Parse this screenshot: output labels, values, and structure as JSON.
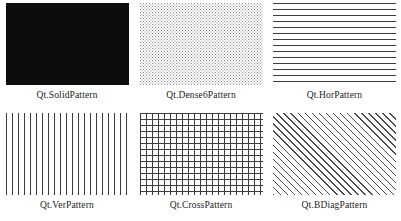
{
  "page": {
    "background_color": "#ffffff",
    "text_color": "#1c1c1c",
    "columns": 3,
    "rows": 2
  },
  "swatches": [
    {
      "label": "Qt.SolidPattern",
      "pattern": "solid",
      "pattern_css_class": "p-solid",
      "fill_color": "#0d0d0d",
      "swatch_width": 123,
      "swatch_height": 82
    },
    {
      "label": "Qt.Dense6Pattern",
      "pattern": "dense-dots",
      "pattern_css_class": "p-dense6",
      "fill_color": "#8a8a8a",
      "swatch_width": 123,
      "swatch_height": 82
    },
    {
      "label": "Qt.HorPattern",
      "pattern": "horizontal-lines",
      "pattern_css_class": "p-hor",
      "fill_color": "#3c3c3c",
      "swatch_width": 123,
      "swatch_height": 82
    },
    {
      "label": "Qt.VerPattern",
      "pattern": "vertical-lines",
      "pattern_css_class": "p-ver",
      "fill_color": "#3c3c3c",
      "swatch_width": 123,
      "swatch_height": 82
    },
    {
      "label": "Qt.CrossPattern",
      "pattern": "crosshatch-grid",
      "pattern_css_class": "p-cross",
      "fill_color": "#3c3c3c",
      "swatch_width": 123,
      "swatch_height": 82
    },
    {
      "label": "Qt.BDiagPattern",
      "pattern": "backward-diagonal-lines",
      "pattern_css_class": "p-bdiag",
      "fill_color": "#4a4a4a",
      "swatch_width": 123,
      "swatch_height": 82
    }
  ]
}
